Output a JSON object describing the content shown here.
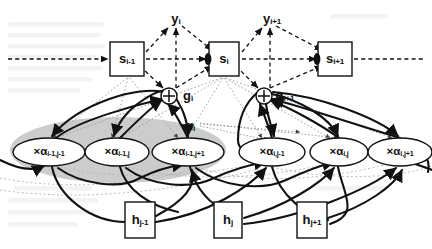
{
  "figure": {
    "type": "diagram",
    "background": "#ffffff",
    "ink_color": "#111111",
    "highlight_color": "#c9c9c9"
  },
  "legend": {
    "solid_arrow": "solid bold arrow",
    "dashed_arrow": "dashed arrow",
    "dotted_arrow": "dotted thin arrow"
  },
  "nodes": {
    "state_boxes": [
      {
        "id": "s-prev",
        "text": "s",
        "sub": "i-1",
        "x": 127,
        "y": 59,
        "w": 34,
        "h": 34,
        "shape": "rect"
      },
      {
        "id": "s-cur",
        "text": "s",
        "sub": "i",
        "x": 224,
        "y": 59,
        "w": 30,
        "h": 34,
        "shape": "rect"
      },
      {
        "id": "s-next",
        "text": "s",
        "sub": "i+1",
        "x": 335,
        "y": 59,
        "w": 34,
        "h": 34,
        "shape": "rect"
      }
    ],
    "output_labels": [
      {
        "id": "y-cur",
        "text": "y",
        "sub": "i",
        "x": 176,
        "y": 19
      },
      {
        "id": "y-next",
        "text": "y",
        "sub": "i+1",
        "x": 270,
        "y": 19
      }
    ],
    "gate_nodes": [
      {
        "id": "g-cur",
        "text": "g",
        "sub": "i",
        "x": 169,
        "y": 96,
        "label_x": 186,
        "label_y": 96,
        "r": 8,
        "glyph": "plus"
      },
      {
        "id": "g-next",
        "text": "g",
        "sub": "i+1",
        "x": 264,
        "y": 96,
        "label_x": 281,
        "label_y": 96,
        "r": 8,
        "glyph": "plus"
      }
    ],
    "alpha_nodes": [
      {
        "id": "a-im1-jm1",
        "prefix": "×α",
        "sub": "i-1,j-1",
        "x": 49,
        "y": 152,
        "rx": 36,
        "ry": 14
      },
      {
        "id": "a-im1-j",
        "prefix": "×α",
        "sub": "i-1,j",
        "x": 117,
        "y": 152,
        "rx": 32,
        "ry": 14
      },
      {
        "id": "a-im1-jp1",
        "prefix": "×α",
        "sub": "i-1,j+1",
        "x": 188,
        "y": 152,
        "rx": 36,
        "ry": 14
      },
      {
        "id": "a-i-jm1",
        "prefix": "×α",
        "sub": "i,j-1",
        "x": 272,
        "y": 152,
        "rx": 33,
        "ry": 14
      },
      {
        "id": "a-i-j",
        "prefix": "×α",
        "sub": "i,j",
        "x": 339,
        "y": 152,
        "rx": 29,
        "ry": 14
      },
      {
        "id": "a-i-jp1",
        "prefix": "×α",
        "sub": "i,j+1",
        "x": 400,
        "y": 152,
        "rx": 32,
        "ry": 14
      }
    ],
    "h_boxes": [
      {
        "id": "h-jm1",
        "text": "h",
        "sub": "j-1",
        "x": 140,
        "y": 220,
        "w": 30,
        "h": 36
      },
      {
        "id": "h-j",
        "text": "h",
        "sub": "j",
        "x": 228,
        "y": 220,
        "w": 28,
        "h": 36
      },
      {
        "id": "h-jp1",
        "text": "h",
        "sub": "j+1",
        "x": 312,
        "y": 220,
        "w": 30,
        "h": 36
      }
    ],
    "annotations": [
      {
        "id": "alpha-group",
        "text": "α",
        "sub": "i",
        "x": 190,
        "y": 126
      }
    ],
    "highlight_region": {
      "id": "alpha-group-shade",
      "shape": "ellipse",
      "cx": 118,
      "cy": 150,
      "rx": 108,
      "ry": 33,
      "color": "#c9c9c9"
    }
  }
}
